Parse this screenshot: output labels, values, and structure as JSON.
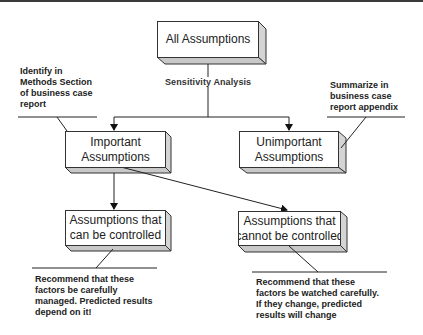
{
  "diagram": {
    "type": "flowchart",
    "nodes": {
      "root": {
        "label": "All Assumptions"
      },
      "important": {
        "label": "Important Assumptions",
        "line1": "Important",
        "line2": "Assumptions"
      },
      "unimportant": {
        "label": "Unimportant Assumptions",
        "line1": "Unimportant",
        "line2": "Assumptions"
      },
      "controlled": {
        "label": "Assumptions that can be controlled",
        "line1": "Assumptions that",
        "line2": "can be controlled"
      },
      "uncontrolled": {
        "label": "Assumptions that cannot be controlled",
        "line1": "Assumptions that",
        "line2": "cannot be controlled"
      }
    },
    "edge_labels": {
      "root_split": "Sensitivity Analysis"
    },
    "edges": [
      {
        "from": "root",
        "to": "important",
        "label": "Sensitivity Analysis"
      },
      {
        "from": "root",
        "to": "unimportant",
        "label": "Sensitivity Analysis"
      },
      {
        "from": "important",
        "to": "controlled"
      },
      {
        "from": "important",
        "to": "uncontrolled"
      }
    ],
    "notes": {
      "important": {
        "line1": "Identify in",
        "line2": "Methods Section",
        "line3": "of business case",
        "line4": "report"
      },
      "unimportant": {
        "line1": "Summarize in",
        "line2": "business case",
        "line3": "report appendix"
      },
      "controlled": {
        "line1": "Recommend that these",
        "line2": "factors be carefully",
        "line3": "managed.  Predicted results",
        "line4": "depend on it!"
      },
      "uncontrolled": {
        "line1": "Recommend that these",
        "line2": "factors be watched carefully.",
        "line3": "If they change, predicted",
        "line4": "results will change"
      }
    },
    "colors": {
      "line": "#222222",
      "box_face": "#ffffff",
      "box_side": "#d4d4d4",
      "box_bottom": "#c8c8c8",
      "top_border": "#3a3a3a"
    }
  }
}
